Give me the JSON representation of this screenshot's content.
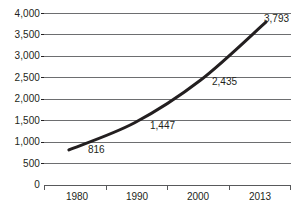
{
  "chart_data": {
    "type": "line",
    "title": "",
    "subtitle": "",
    "xlabel": "",
    "ylabel": "",
    "categories": [
      "1980",
      "1990",
      "2000",
      "2013"
    ],
    "x": [
      1980,
      1990,
      2000,
      2013
    ],
    "values": [
      816,
      1447,
      2435,
      3793
    ],
    "point_labels": [
      "816",
      "1,447",
      "2,435",
      "3,793"
    ],
    "ylim": [
      0,
      4000
    ],
    "yticks": [
      0,
      500,
      1000,
      1500,
      2000,
      2500,
      3000,
      3500,
      4000
    ],
    "ytick_labels": [
      "0",
      "500",
      "1,000",
      "1,500",
      "2,000",
      "2,500",
      "3,000",
      "3,500",
      "4,000"
    ],
    "grid": true,
    "grid_axis": "y",
    "legend": false,
    "legend_position": "none",
    "series": [
      {
        "name": "",
        "values": [
          816,
          1447,
          2435,
          3793
        ],
        "line_color": "#231f20",
        "line_width": 3,
        "smooth": true,
        "markers": false
      }
    ],
    "colors": {
      "line": "#231f20",
      "gridline": "#6d6e70",
      "axis": "#58595b",
      "text": "#231f20",
      "background": "#ffffff"
    }
  }
}
